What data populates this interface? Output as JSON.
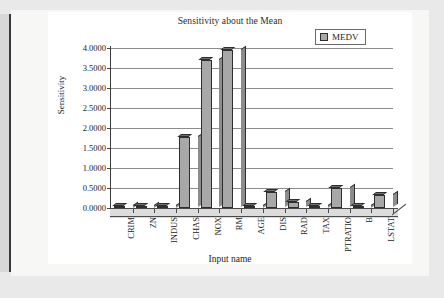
{
  "chart_data": {
    "type": "bar",
    "title": "Sensitivity about the Mean",
    "xlabel": "Input name",
    "ylabel": "Sensitivity",
    "categories": [
      "CRIM",
      "ZN",
      "INDUS",
      "CHAS",
      "NOX",
      "RM",
      "AGE",
      "DIS",
      "RAD",
      "TAX",
      "PTRATIO",
      "B",
      "LSTAT"
    ],
    "series": [
      {
        "name": "MEDV",
        "values": [
          0.03,
          0.03,
          0.06,
          1.78,
          3.7,
          3.95,
          0.03,
          0.4,
          0.15,
          0.04,
          0.5,
          0.02,
          0.33
        ]
      }
    ],
    "ylim": [
      0,
      4
    ],
    "ytick_labels": [
      "0.0000",
      "0.5000",
      "1.0000",
      "1.5000",
      "2.0000",
      "2.5000",
      "3.0000",
      "3.5000",
      "4.0000"
    ],
    "ytick_values": [
      0,
      0.5,
      1,
      1.5,
      2,
      2.5,
      3,
      3.5,
      4
    ],
    "grid": true,
    "legend_position": "top-right",
    "style": "3d-column",
    "colors": {
      "bar_face": "#a8a8a8",
      "bar_side": "#8c8c8c",
      "bar_top": "#6f6f6f",
      "bar_outline": "#2e2e2e",
      "gridline": "#8d8d8d",
      "axis": "#3c3c3c",
      "plot_background": "#ffffff",
      "floor": "#dcdcdc",
      "page_background": "#e9e9e9",
      "sheet_background": "#f7f7f5"
    }
  },
  "legend": {
    "entries": [
      {
        "label": "MEDV",
        "swatch_icon": "legend-swatch-icon"
      }
    ]
  }
}
